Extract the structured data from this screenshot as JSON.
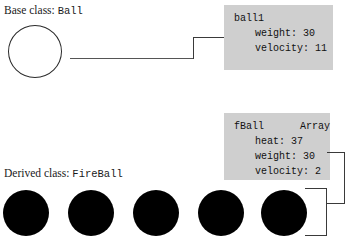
{
  "diagram": {
    "base": {
      "label_prefix": "Base class:",
      "class_name": "Ball"
    },
    "derived": {
      "label_prefix": "Derived class:",
      "class_name": "FireBall"
    },
    "ball_object": {
      "header": "ball1",
      "fields": [
        "weight: 30",
        "velocity: 11"
      ]
    },
    "fball_array": {
      "header": "fBall      Array",
      "fields": [
        "heat: 37",
        "weight: 30",
        "velocity: 2"
      ]
    },
    "colors": {
      "box_fill": "#cfcfcf",
      "ball_fill": "#000000",
      "ball_stroke": "#2b2b2b",
      "line": "#3a3a3a",
      "text": "#1a1a1a",
      "background": "#ffffff"
    },
    "ball_count": 5
  }
}
